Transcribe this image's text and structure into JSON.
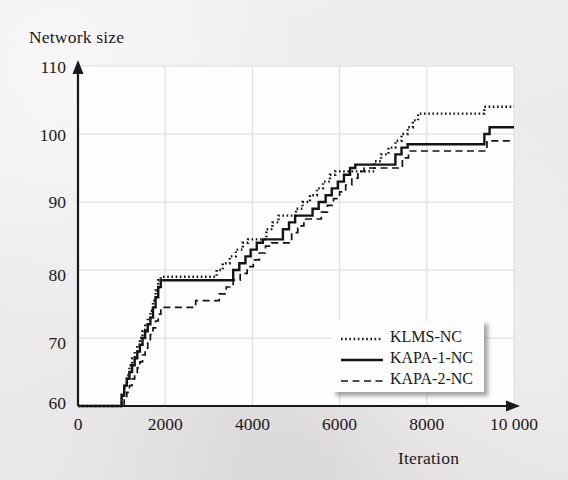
{
  "figure": {
    "background_color": "#eceaea",
    "plot_background_color": "#fdfdfd",
    "line_color": "#141414",
    "grid_color": "#dcdcdc"
  },
  "chart_data": {
    "type": "line",
    "title": "",
    "xlabel": "Iteration",
    "ylabel": "Network size",
    "xlim": [
      0,
      10000
    ],
    "ylim": [
      60,
      110
    ],
    "xticks": [
      0,
      2000,
      4000,
      6000,
      8000,
      10000
    ],
    "xticklabels": [
      "0",
      "2000",
      "4000",
      "6000",
      "8000",
      "10 000"
    ],
    "yticks": [
      60,
      70,
      80,
      90,
      100,
      110
    ],
    "yticklabels": [
      "60",
      "70",
      "80",
      "90",
      "100",
      "110"
    ],
    "grid": true,
    "legend_position": "lower right inside",
    "step_style": "post",
    "series": [
      {
        "name": "KLMS-NC",
        "style": "dotted",
        "points": [
          [
            0,
            60
          ],
          [
            960,
            60
          ],
          [
            1000,
            62
          ],
          [
            1060,
            63
          ],
          [
            1120,
            64.5
          ],
          [
            1180,
            66
          ],
          [
            1240,
            67
          ],
          [
            1300,
            68
          ],
          [
            1360,
            69
          ],
          [
            1420,
            70
          ],
          [
            1480,
            71
          ],
          [
            1540,
            72
          ],
          [
            1600,
            73
          ],
          [
            1660,
            74
          ],
          [
            1720,
            75.5
          ],
          [
            1780,
            77
          ],
          [
            1840,
            78.5
          ],
          [
            1900,
            79
          ],
          [
            3080,
            79
          ],
          [
            3180,
            80
          ],
          [
            3320,
            81
          ],
          [
            3480,
            82
          ],
          [
            3620,
            83
          ],
          [
            3780,
            84
          ],
          [
            3900,
            84.5
          ],
          [
            4200,
            84.5
          ],
          [
            4320,
            86
          ],
          [
            4460,
            87
          ],
          [
            4600,
            88
          ],
          [
            4860,
            88
          ],
          [
            5000,
            89
          ],
          [
            5150,
            90
          ],
          [
            5320,
            91
          ],
          [
            5480,
            92
          ],
          [
            5620,
            93
          ],
          [
            5780,
            94
          ],
          [
            5900,
            94.5
          ],
          [
            6680,
            94.5
          ],
          [
            6800,
            96
          ],
          [
            6950,
            97
          ],
          [
            7120,
            98
          ],
          [
            7280,
            99
          ],
          [
            7420,
            100
          ],
          [
            7560,
            101
          ],
          [
            7680,
            102
          ],
          [
            7800,
            103
          ],
          [
            9180,
            103
          ],
          [
            9320,
            104
          ],
          [
            10000,
            104
          ]
        ]
      },
      {
        "name": "KAPA-1-NC",
        "style": "solid",
        "points": [
          [
            0,
            60
          ],
          [
            960,
            60
          ],
          [
            1000,
            61.5
          ],
          [
            1060,
            63
          ],
          [
            1120,
            64
          ],
          [
            1180,
            65
          ],
          [
            1240,
            66
          ],
          [
            1300,
            67
          ],
          [
            1360,
            68
          ],
          [
            1420,
            69
          ],
          [
            1480,
            70
          ],
          [
            1540,
            71
          ],
          [
            1600,
            72
          ],
          [
            1660,
            73
          ],
          [
            1720,
            74.5
          ],
          [
            1780,
            76
          ],
          [
            1840,
            77.5
          ],
          [
            1900,
            78.5
          ],
          [
            3440,
            78.5
          ],
          [
            3560,
            80
          ],
          [
            3700,
            81
          ],
          [
            3840,
            82
          ],
          [
            3960,
            83
          ],
          [
            4100,
            84
          ],
          [
            4240,
            84.5
          ],
          [
            4580,
            84.5
          ],
          [
            4700,
            86
          ],
          [
            4840,
            87
          ],
          [
            4980,
            88
          ],
          [
            5240,
            88
          ],
          [
            5380,
            89
          ],
          [
            5520,
            90
          ],
          [
            5680,
            91
          ],
          [
            5820,
            92
          ],
          [
            5960,
            93
          ],
          [
            6100,
            94
          ],
          [
            6240,
            95
          ],
          [
            6360,
            95.5
          ],
          [
            7140,
            95.5
          ],
          [
            7280,
            97
          ],
          [
            7420,
            98
          ],
          [
            7560,
            98.5
          ],
          [
            9180,
            98.5
          ],
          [
            9320,
            100
          ],
          [
            9440,
            101
          ],
          [
            10000,
            101
          ]
        ]
      },
      {
        "name": "KAPA-2-NC",
        "style": "dashed",
        "points": [
          [
            0,
            60
          ],
          [
            1000,
            60
          ],
          [
            1060,
            61
          ],
          [
            1120,
            62
          ],
          [
            1180,
            63
          ],
          [
            1240,
            64
          ],
          [
            1300,
            64.8
          ],
          [
            1360,
            65.6
          ],
          [
            1420,
            66.5
          ],
          [
            1480,
            67.5
          ],
          [
            1540,
            68.5
          ],
          [
            1600,
            69.5
          ],
          [
            1660,
            70.5
          ],
          [
            1720,
            71.5
          ],
          [
            1780,
            72.5
          ],
          [
            1840,
            73.5
          ],
          [
            1900,
            74.5
          ],
          [
            2540,
            74.5
          ],
          [
            2700,
            75.5
          ],
          [
            3100,
            75.5
          ],
          [
            3240,
            76.5
          ],
          [
            3400,
            77.5
          ],
          [
            3560,
            78.5
          ],
          [
            3720,
            79.5
          ],
          [
            3880,
            80.5
          ],
          [
            4020,
            81.5
          ],
          [
            4160,
            82.5
          ],
          [
            4300,
            83.5
          ],
          [
            4440,
            84
          ],
          [
            4760,
            84
          ],
          [
            4900,
            85.5
          ],
          [
            5040,
            86.5
          ],
          [
            5180,
            87.5
          ],
          [
            5440,
            87.5
          ],
          [
            5580,
            88.5
          ],
          [
            5720,
            89.5
          ],
          [
            5860,
            90.5
          ],
          [
            6000,
            91.5
          ],
          [
            6140,
            92.5
          ],
          [
            6280,
            93.5
          ],
          [
            6420,
            94.5
          ],
          [
            6560,
            95
          ],
          [
            7300,
            95
          ],
          [
            7440,
            96.5
          ],
          [
            7580,
            97.5
          ],
          [
            9240,
            97.5
          ],
          [
            9380,
            99
          ],
          [
            10000,
            99
          ]
        ]
      }
    ]
  },
  "legend": {
    "items": [
      {
        "label": "KLMS-NC",
        "style": "dotted"
      },
      {
        "label": "KAPA-1-NC",
        "style": "solid"
      },
      {
        "label": "KAPA-2-NC",
        "style": "dashed"
      }
    ]
  }
}
